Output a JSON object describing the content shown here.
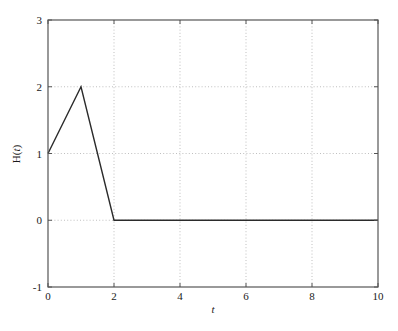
{
  "chart_data": {
    "type": "line",
    "title": "",
    "xlabel": "t",
    "ylabel": "H(t)",
    "ylabel_parts": {
      "fn": "H",
      "open": "(",
      "var": "t",
      "close": ")"
    },
    "xlim": [
      0,
      10
    ],
    "ylim": [
      -1,
      3
    ],
    "xticks": [
      0,
      2,
      4,
      6,
      8,
      10
    ],
    "xtick_labels": [
      "0",
      "2",
      "4",
      "6",
      "8",
      "10"
    ],
    "yticks": [
      -1,
      0,
      1,
      2,
      3
    ],
    "ytick_labels": [
      "-1",
      "0",
      "1",
      "2",
      "3"
    ],
    "grid": true,
    "grid_style": "dotted",
    "grid_color": "#b8b8b8",
    "grid_x_values": [
      2,
      4,
      6,
      8
    ],
    "grid_y_values": [
      0,
      1,
      2
    ],
    "legend": null,
    "series": [
      {
        "name": "H(t)",
        "color": "#2b2b2b",
        "linewidth": 1.4,
        "x": [
          0,
          1,
          2,
          10
        ],
        "y": [
          1,
          2,
          0,
          0
        ],
        "points": [
          {
            "t": 0,
            "H": 1
          },
          {
            "t": 1,
            "H": 2
          },
          {
            "t": 2,
            "H": 0
          },
          {
            "t": 10,
            "H": 0
          }
        ]
      }
    ],
    "annotations": []
  },
  "axes": {
    "frame_color": "#555555",
    "tick_color": "#555555",
    "background": "#ffffff"
  }
}
